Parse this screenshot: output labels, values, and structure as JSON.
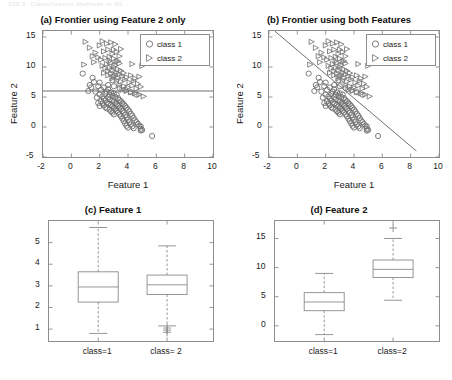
{
  "page": {
    "faint_header": "100        2. Classification Methods in ML"
  },
  "figure": {
    "panels": [
      {
        "id": "a",
        "title": "(a) Frontier using Feature 2 only",
        "xlabel": "Feature 1",
        "ylabel": "Feature 2",
        "legend": [
          {
            "marker": "circle-marker",
            "label": "class 1"
          },
          {
            "marker": "triangle-right-marker",
            "label": "class 2"
          }
        ]
      },
      {
        "id": "b",
        "title": "(b) Frontier using both Features",
        "xlabel": "Feature 1",
        "ylabel": "Feature 2",
        "legend": [
          {
            "marker": "circle-marker",
            "label": "class 1"
          },
          {
            "marker": "triangle-right-marker",
            "label": "class 2"
          }
        ]
      },
      {
        "id": "c",
        "title": "(c) Feature 1",
        "xlabel": "",
        "ylabel": ""
      },
      {
        "id": "d",
        "title": "(d) Feature 2",
        "xlabel": "",
        "ylabel": ""
      }
    ]
  },
  "chart_data": [
    {
      "type": "scatter",
      "panel": "a",
      "title": "(a) Frontier using Feature 2 only",
      "xlabel": "Feature 1",
      "ylabel": "Feature 2",
      "xlim": [
        -2,
        10
      ],
      "ylim": [
        -5,
        16
      ],
      "xticks": [
        -2,
        0,
        2,
        4,
        6,
        8,
        10
      ],
      "yticks": [
        -5,
        0,
        5,
        10,
        15
      ],
      "grid": false,
      "legend": [
        "class 1",
        "class 2"
      ],
      "legend_position": "top-right",
      "annotations": [
        {
          "kind": "hline",
          "y": 6.0,
          "label": "decision threshold on Feature 2"
        }
      ],
      "series": [
        {
          "name": "class 1",
          "marker": "circle",
          "points": [
            [
              0.8,
              8.9
            ],
            [
              1.5,
              8.2
            ],
            [
              1.6,
              7.5
            ],
            [
              1.4,
              6.6
            ],
            [
              1.9,
              6.8
            ],
            [
              2.0,
              7.4
            ],
            [
              1.2,
              6.0
            ],
            [
              1.7,
              5.9
            ],
            [
              2.1,
              6.2
            ],
            [
              2.3,
              6.6
            ],
            [
              2.0,
              5.4
            ],
            [
              2.2,
              5.1
            ],
            [
              1.8,
              4.9
            ],
            [
              2.4,
              5.5
            ],
            [
              2.5,
              5.9
            ],
            [
              2.6,
              6.3
            ],
            [
              2.3,
              4.7
            ],
            [
              2.1,
              4.3
            ],
            [
              1.9,
              4.0
            ],
            [
              2.6,
              5.0
            ],
            [
              2.7,
              5.4
            ],
            [
              2.8,
              5.8
            ],
            [
              2.4,
              4.4
            ],
            [
              2.2,
              3.9
            ],
            [
              2.0,
              3.5
            ],
            [
              2.9,
              5.2
            ],
            [
              3.0,
              5.6
            ],
            [
              2.7,
              4.6
            ],
            [
              2.5,
              4.1
            ],
            [
              2.3,
              3.6
            ],
            [
              3.1,
              5.0
            ],
            [
              3.2,
              5.4
            ],
            [
              2.9,
              4.4
            ],
            [
              2.6,
              3.9
            ],
            [
              2.4,
              3.3
            ],
            [
              3.3,
              4.8
            ],
            [
              3.0,
              4.2
            ],
            [
              2.8,
              3.7
            ],
            [
              2.5,
              3.1
            ],
            [
              3.4,
              4.5
            ],
            [
              3.1,
              4.0
            ],
            [
              2.9,
              3.4
            ],
            [
              2.7,
              2.9
            ],
            [
              3.5,
              4.3
            ],
            [
              3.2,
              3.8
            ],
            [
              3.0,
              3.2
            ],
            [
              2.8,
              2.6
            ],
            [
              3.6,
              4.0
            ],
            [
              3.3,
              3.5
            ],
            [
              3.1,
              3.0
            ],
            [
              2.9,
              2.4
            ],
            [
              3.7,
              3.8
            ],
            [
              3.4,
              3.2
            ],
            [
              3.2,
              2.7
            ],
            [
              3.0,
              2.1
            ],
            [
              3.8,
              3.5
            ],
            [
              3.5,
              3.0
            ],
            [
              3.3,
              2.4
            ],
            [
              3.9,
              3.2
            ],
            [
              3.6,
              2.7
            ],
            [
              3.4,
              2.1
            ],
            [
              4.0,
              2.9
            ],
            [
              3.7,
              2.4
            ],
            [
              3.5,
              1.8
            ],
            [
              4.1,
              2.6
            ],
            [
              3.8,
              2.0
            ],
            [
              3.6,
              1.4
            ],
            [
              4.2,
              2.2
            ],
            [
              3.9,
              1.6
            ],
            [
              3.7,
              1.0
            ],
            [
              4.3,
              1.9
            ],
            [
              4.0,
              1.2
            ],
            [
              3.8,
              0.6
            ],
            [
              4.4,
              1.5
            ],
            [
              4.1,
              0.8
            ],
            [
              3.9,
              0.2
            ],
            [
              4.5,
              1.1
            ],
            [
              4.2,
              0.4
            ],
            [
              4.0,
              -0.1
            ],
            [
              4.6,
              0.8
            ],
            [
              4.3,
              0.1
            ],
            [
              4.7,
              0.5
            ],
            [
              4.4,
              -0.2
            ],
            [
              4.8,
              0.2
            ],
            [
              4.9,
              0.1
            ],
            [
              4.9,
              -0.3
            ],
            [
              4.9,
              -0.6
            ],
            [
              5.0,
              -0.5
            ],
            [
              5.7,
              -1.5
            ],
            [
              2.6,
              7.0
            ],
            [
              3.0,
              6.8
            ],
            [
              3.4,
              6.5
            ],
            [
              3.8,
              6.2
            ],
            [
              4.2,
              5.8
            ],
            [
              4.6,
              5.4
            ],
            [
              1.3,
              7.0
            ],
            [
              2.9,
              7.8
            ]
          ]
        },
        {
          "name": "class 2",
          "marker": "triangle-right",
          "points": [
            [
              1.0,
              14.2
            ],
            [
              1.3,
              13.2
            ],
            [
              1.7,
              12.4
            ],
            [
              2.0,
              13.6
            ],
            [
              2.2,
              14.3
            ],
            [
              2.5,
              13.9
            ],
            [
              2.8,
              14.1
            ],
            [
              3.1,
              13.8
            ],
            [
              1.5,
              11.8
            ],
            [
              1.9,
              11.6
            ],
            [
              2.3,
              12.6
            ],
            [
              2.6,
              12.9
            ],
            [
              2.9,
              12.2
            ],
            [
              3.2,
              12.5
            ],
            [
              3.5,
              13.0
            ],
            [
              0.9,
              10.4
            ],
            [
              1.6,
              10.8
            ],
            [
              2.1,
              11.2
            ],
            [
              2.4,
              11.5
            ],
            [
              2.7,
              11.7
            ],
            [
              3.0,
              11.4
            ],
            [
              3.3,
              11.0
            ],
            [
              2.2,
              10.2
            ],
            [
              2.5,
              10.5
            ],
            [
              2.8,
              10.7
            ],
            [
              3.1,
              10.3
            ],
            [
              3.4,
              10.6
            ],
            [
              4.3,
              10.5
            ],
            [
              5.0,
              10.2
            ],
            [
              2.4,
              9.8
            ],
            [
              2.7,
              9.9
            ],
            [
              3.0,
              10.0
            ],
            [
              3.3,
              9.6
            ],
            [
              2.6,
              9.3
            ],
            [
              2.9,
              9.5
            ],
            [
              3.2,
              9.1
            ],
            [
              3.5,
              9.4
            ],
            [
              2.8,
              8.9
            ],
            [
              3.1,
              8.7
            ],
            [
              3.4,
              8.8
            ],
            [
              3.7,
              9.0
            ],
            [
              3.0,
              8.4
            ],
            [
              3.3,
              8.2
            ],
            [
              3.6,
              8.5
            ],
            [
              3.9,
              8.3
            ],
            [
              4.2,
              8.6
            ],
            [
              4.5,
              8.1
            ],
            [
              4.8,
              8.4
            ],
            [
              3.2,
              7.8
            ],
            [
              3.5,
              7.6
            ],
            [
              3.8,
              7.9
            ],
            [
              4.1,
              7.4
            ],
            [
              4.4,
              7.7
            ],
            [
              4.7,
              7.2
            ],
            [
              3.4,
              7.0
            ],
            [
              3.7,
              6.8
            ],
            [
              4.0,
              6.6
            ],
            [
              4.3,
              6.9
            ],
            [
              4.6,
              6.4
            ],
            [
              4.9,
              6.7
            ],
            [
              3.6,
              6.2
            ],
            [
              3.9,
              6.0
            ],
            [
              4.2,
              5.8
            ],
            [
              4.5,
              5.6
            ],
            [
              4.8,
              5.4
            ],
            [
              5.1,
              5.1
            ],
            [
              2.3,
              9.0
            ],
            [
              2.6,
              8.6
            ],
            [
              2.9,
              8.1
            ],
            [
              3.0,
              12.9
            ],
            [
              2.7,
              11.0
            ],
            [
              3.2,
              10.9
            ],
            [
              3.4,
              11.8
            ]
          ]
        }
      ]
    },
    {
      "type": "scatter",
      "panel": "b",
      "title": "(b) Frontier using both Features",
      "xlabel": "Feature 1",
      "ylabel": "Feature 2",
      "xlim": [
        -2,
        10
      ],
      "ylim": [
        -5,
        16
      ],
      "xticks": [
        -2,
        0,
        2,
        4,
        6,
        8,
        10
      ],
      "yticks": [
        -5,
        0,
        5,
        10,
        15
      ],
      "grid": false,
      "legend": [
        "class 1",
        "class 2"
      ],
      "legend_position": "top-right",
      "annotations": [
        {
          "kind": "line",
          "x0": -1.6,
          "y0": 16.0,
          "x1": 8.4,
          "y1": -4.0,
          "label": "linear decision boundary",
          "slope": -2.0,
          "intercept": 12.8
        }
      ],
      "series": [
        {
          "name": "class 1",
          "marker": "circle",
          "same_points_as": "a"
        },
        {
          "name": "class 2",
          "marker": "triangle-right",
          "same_points_as": "a"
        }
      ]
    },
    {
      "type": "boxplot",
      "panel": "c",
      "title": "(c) Feature 1",
      "xlabel": "",
      "ylabel": "",
      "categories": [
        "class=1",
        "class= 2"
      ],
      "ylim": [
        0.45,
        6.0
      ],
      "yticks": [
        1,
        2,
        3,
        4,
        5
      ],
      "grid": false,
      "boxes": [
        {
          "label": "class=1",
          "whisker_low": 0.8,
          "q1": 2.25,
          "median": 2.95,
          "q3": 3.65,
          "whisker_high": 5.7,
          "outliers": []
        },
        {
          "label": "class= 2",
          "whisker_low": 1.15,
          "q1": 2.6,
          "median": 3.05,
          "q3": 3.5,
          "whisker_high": 4.85,
          "outliers": [
            1.05,
            0.95,
            0.85
          ]
        }
      ]
    },
    {
      "type": "boxplot",
      "panel": "d",
      "title": "(d) Feature 2",
      "xlabel": "",
      "ylabel": "",
      "categories": [
        "class=1",
        "class=2"
      ],
      "ylim": [
        -2.6,
        18.0
      ],
      "yticks": [
        0,
        5,
        10,
        15
      ],
      "grid": false,
      "boxes": [
        {
          "label": "class=1",
          "whisker_low": -1.5,
          "q1": 2.6,
          "median": 4.1,
          "q3": 5.7,
          "whisker_high": 9.0,
          "outliers": []
        },
        {
          "label": "class=2",
          "whisker_low": 4.4,
          "q1": 8.3,
          "median": 9.7,
          "q3": 11.3,
          "whisker_high": 15.0,
          "outliers": [
            16.8
          ]
        }
      ]
    }
  ]
}
